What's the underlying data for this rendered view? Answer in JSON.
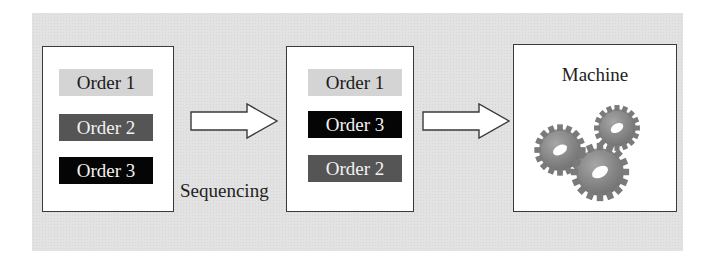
{
  "diagram": {
    "input_queue": {
      "orders": [
        {
          "label": "Order 1",
          "shade": "light"
        },
        {
          "label": "Order 2",
          "shade": "mid"
        },
        {
          "label": "Order 3",
          "shade": "dark"
        }
      ]
    },
    "step_label": "Sequencing",
    "sequenced_queue": {
      "orders": [
        {
          "label": "Order 1",
          "shade": "light"
        },
        {
          "label": "Order 3",
          "shade": "dark"
        },
        {
          "label": "Order 2",
          "shade": "mid"
        }
      ]
    },
    "machine": {
      "label": "Machine",
      "icon": "gears-icon"
    },
    "colors": {
      "background": "#e2e2e2",
      "light": "#d4d4d4",
      "mid": "#555555",
      "dark": "#050505",
      "gear": "#8a8a8a"
    }
  }
}
